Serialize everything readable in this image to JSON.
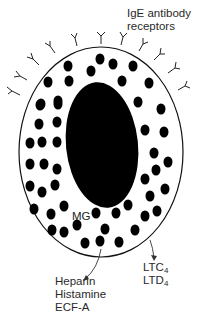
{
  "diagram": {
    "colors": {
      "ink": "#000000",
      "text": "#2a2a2a",
      "background": "#ffffff"
    },
    "labels": {
      "receptors_line1": "IgE antibody",
      "receptors_line2": "receptors",
      "granule": "MG",
      "mediators_granule": [
        "Heparin",
        "Histamine",
        "ECF-A"
      ],
      "mediators_membrane": [
        {
          "base": "LTC",
          "sub": "4"
        },
        {
          "base": "LTD",
          "sub": "4"
        }
      ]
    },
    "components": {
      "cell_membrane": "cell-outline",
      "nucleus": "nucleus",
      "granules": "granules",
      "receptors": "IgE antibody receptors (Y-shaped)",
      "arrows": [
        "granule-release-arrow",
        "leukotriene-release-arrow"
      ]
    }
  }
}
